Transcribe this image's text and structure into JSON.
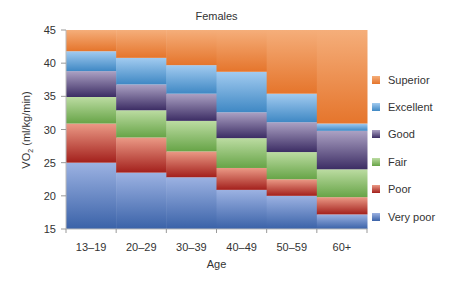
{
  "chart_data": {
    "type": "bar",
    "subtype": "stacked-range",
    "title": "Females",
    "xlabel": "Age",
    "ylabel": "VO2 (ml/kg/min)",
    "ylabel_main": "VO",
    "ylabel_sub": "2",
    "ylabel_rest": " (ml/kg/min)",
    "ylim": [
      15,
      45
    ],
    "yticks": [
      15,
      20,
      25,
      30,
      35,
      40,
      45
    ],
    "grid": false,
    "legend_position": "right",
    "categories": [
      "13–19",
      "20–29",
      "30–39",
      "40–49",
      "50–59",
      "60+"
    ],
    "series": [
      {
        "name": "Very poor",
        "color_top": "#9cb2e2",
        "color_bottom": "#3a62a8",
        "lower": [
          15,
          15,
          15,
          15,
          15,
          15
        ],
        "upper": [
          25.0,
          23.5,
          22.8,
          20.9,
          20.0,
          17.2
        ]
      },
      {
        "name": "Poor",
        "color_top": "#eb9a86",
        "color_bottom": "#a3201c",
        "lower": [
          25.0,
          23.5,
          22.8,
          20.9,
          20.0,
          17.2
        ],
        "upper": [
          30.9,
          28.8,
          26.7,
          24.2,
          22.5,
          19.8
        ]
      },
      {
        "name": "Fair",
        "color_top": "#bcdca2",
        "color_bottom": "#67a447",
        "lower": [
          30.9,
          28.8,
          26.7,
          24.2,
          22.5,
          19.8
        ],
        "upper": [
          34.9,
          32.9,
          31.3,
          28.7,
          26.6,
          24.0
        ]
      },
      {
        "name": "Good",
        "color_top": "#aca2c4",
        "color_bottom": "#3c2d64",
        "lower": [
          34.9,
          32.9,
          31.3,
          28.7,
          26.6,
          24.0
        ],
        "upper": [
          38.8,
          36.8,
          35.4,
          32.6,
          31.1,
          29.8
        ]
      },
      {
        "name": "Excellent",
        "color_top": "#a2cbf0",
        "color_bottom": "#3f88c4",
        "lower": [
          38.8,
          36.8,
          35.4,
          32.6,
          31.1,
          29.8
        ],
        "upper": [
          41.8,
          40.8,
          39.7,
          38.7,
          35.4,
          30.9
        ]
      },
      {
        "name": "Superior",
        "color_top": "#f5ae7a",
        "color_bottom": "#e5752c",
        "lower": [
          41.8,
          40.8,
          39.7,
          38.7,
          35.4,
          30.9
        ],
        "upper": [
          45,
          45,
          45,
          45,
          45,
          45
        ]
      }
    ],
    "legend_order": [
      "Superior",
      "Excellent",
      "Good",
      "Fair",
      "Poor",
      "Very poor"
    ]
  }
}
